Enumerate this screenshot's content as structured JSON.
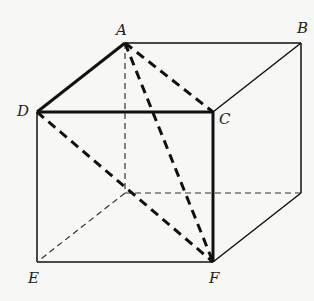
{
  "figure": {
    "type": "cube",
    "labels": {
      "A": "A",
      "B": "B",
      "C": "C",
      "D": "D",
      "E": "E",
      "F": "F"
    },
    "colors": {
      "background": "#f7f7f5",
      "stroke": "#111111",
      "label": "#222222"
    }
  }
}
